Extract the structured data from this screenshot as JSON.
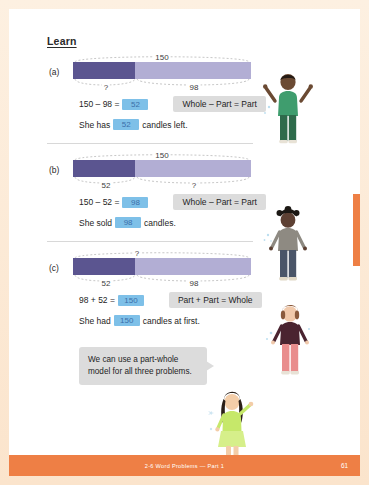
{
  "page": {
    "section_title": "Learn",
    "footer_title": "2-6  Word Problems — Part 1",
    "page_number": "61",
    "accent_color": "#ee7f45",
    "bar_dark_color": "#5b5590",
    "bar_light_color": "#b2aed4",
    "answer_fill_color": "#7ec0e8",
    "rule_box_color": "#dcdcdc"
  },
  "problems": [
    {
      "label": "(a)",
      "bar": {
        "top_label": "150",
        "top_span": "whole",
        "left_label": "?",
        "right_label": "98",
        "dark_fraction": 0.35
      },
      "equation": {
        "left": "150 – 98 =",
        "answer": "52"
      },
      "rule": "Whole – Part = Part",
      "sentence_before": "She has",
      "sentence_answer": "52",
      "sentence_after": "candles left."
    },
    {
      "label": "(b)",
      "bar": {
        "top_label": "150",
        "top_span": "whole",
        "left_label": "52",
        "right_label": "?",
        "dark_fraction": 0.35
      },
      "equation": {
        "left": "150 – 52 =",
        "answer": "98"
      },
      "rule": "Whole – Part = Part",
      "sentence_before": "She sold",
      "sentence_answer": "98",
      "sentence_after": "candles."
    },
    {
      "label": "(c)",
      "bar": {
        "top_label": "?",
        "top_span": "whole",
        "left_label": "52",
        "right_label": "98",
        "dark_fraction": 0.35
      },
      "equation": {
        "left": "98 + 52 =",
        "answer": "150"
      },
      "rule": "Part + Part = Whole",
      "sentence_before": "She had",
      "sentence_answer": "150",
      "sentence_after": "candles at first."
    }
  ],
  "callout": {
    "line1": "We can use a part-whole",
    "line2": "model for all three problems."
  },
  "characters": [
    {
      "name": "boy-cheering",
      "shirt": "#3f9d6e",
      "pants": "#2e6b4b",
      "skin": "#6b4a33",
      "hair": "#241a14"
    },
    {
      "name": "boy-standing",
      "shirt": "#8e8a82",
      "pants": "#4a5568",
      "skin": "#5d4033",
      "hair": "#1c1814"
    },
    {
      "name": "girl-standing",
      "shirt": "#4a2430",
      "pants": "#e98d8d",
      "skin": "#f0c9ab",
      "hair": "#8a5a3c"
    },
    {
      "name": "girl-pointing",
      "shirt": "#c6e86a",
      "pants": "#d6ef8a",
      "skin": "#f3cda8",
      "hair": "#2b2018"
    }
  ]
}
